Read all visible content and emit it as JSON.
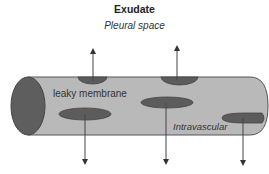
{
  "diagram": {
    "title": "Exudate",
    "subtitle": "Pleural space",
    "labels": {
      "membrane": "leaky membrane",
      "vessel": "Intravascular"
    },
    "colors": {
      "tube_fill": "#b9b9b9",
      "tube_stroke": "#555555",
      "pore_fill": "#5c5c5c",
      "arrow": "#444444"
    },
    "flows": {
      "outward_to_pleural_space": 2,
      "downward_leak": 3
    }
  }
}
